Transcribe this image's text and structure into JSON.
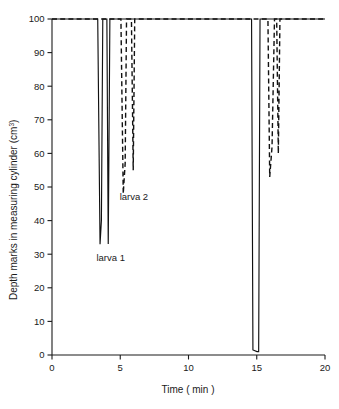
{
  "chart_data": {
    "type": "line",
    "title": "",
    "xlabel": "Time ( min )",
    "ylabel": "Depth marks in measuring cylinder (cm",
    "ylabel_sup": "3",
    "ylabel_tail": ")",
    "xlim": [
      0,
      20
    ],
    "ylim": [
      0,
      100
    ],
    "xticks": [
      0,
      5,
      10,
      15,
      20
    ],
    "yticks": [
      0,
      10,
      20,
      30,
      40,
      50,
      60,
      70,
      80,
      90,
      100
    ],
    "xtick_labels": [
      "0",
      "5",
      "10",
      "15",
      "20"
    ],
    "ytick_labels": [
      "0",
      "10",
      "20",
      "30",
      "40",
      "50",
      "60",
      "70",
      "80",
      "90",
      "100"
    ],
    "grid": false,
    "legend_position": "inline-annotation",
    "series": [
      {
        "name": "larva 1",
        "style": "solid",
        "color": "#111111",
        "annotation": "larva 1",
        "annotation_x": 4.3,
        "annotation_y": 28,
        "points": [
          [
            0.0,
            100
          ],
          [
            3.35,
            100
          ],
          [
            3.52,
            33
          ],
          [
            3.62,
            40
          ],
          [
            3.72,
            100
          ],
          [
            4.02,
            100
          ],
          [
            4.12,
            33
          ],
          [
            4.24,
            100
          ],
          [
            14.62,
            100
          ],
          [
            14.72,
            1.5
          ],
          [
            15.02,
            1.0
          ],
          [
            15.14,
            1.0
          ],
          [
            15.24,
            100
          ],
          [
            20.0,
            100
          ]
        ]
      },
      {
        "name": "larva 2",
        "style": "dashed",
        "color": "#111111",
        "annotation": "larva 2",
        "annotation_x": 6.0,
        "annotation_y": 46,
        "points": [
          [
            0.0,
            100
          ],
          [
            5.05,
            100
          ],
          [
            5.22,
            48
          ],
          [
            5.36,
            57
          ],
          [
            5.46,
            100
          ],
          [
            5.82,
            100
          ],
          [
            5.95,
            55
          ],
          [
            6.06,
            100
          ],
          [
            15.82,
            100
          ],
          [
            15.95,
            53
          ],
          [
            16.12,
            62
          ],
          [
            16.3,
            100
          ],
          [
            16.46,
            100
          ],
          [
            16.58,
            60
          ],
          [
            16.7,
            100
          ],
          [
            20.0,
            100
          ]
        ]
      }
    ],
    "annotations": [
      {
        "text": "larva 1",
        "x": 4.3,
        "y": 28
      },
      {
        "text": "larva 2",
        "x": 6.0,
        "y": 46
      }
    ]
  }
}
